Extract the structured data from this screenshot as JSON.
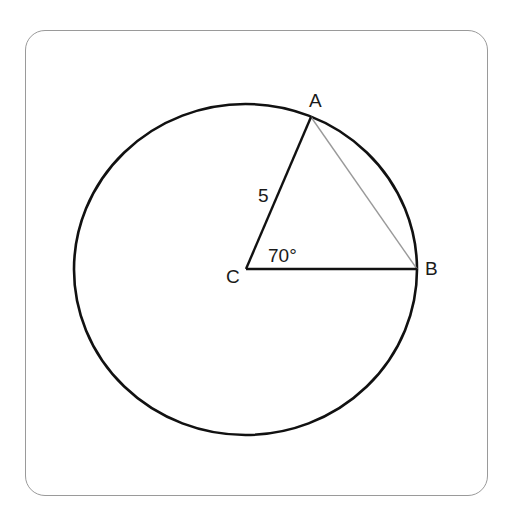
{
  "diagram": {
    "type": "geometry",
    "points": {
      "A": {
        "label": "A",
        "x": 311,
        "y": 117
      },
      "B": {
        "label": "B",
        "x": 417,
        "y": 269
      },
      "C": {
        "label": "C",
        "x": 246,
        "y": 269
      }
    },
    "labels": {
      "point_a": "A",
      "point_b": "B",
      "point_c": "C",
      "radius": "5",
      "angle": "70°"
    },
    "colors": {
      "stroke": "#111111",
      "chord": "#9a9a9a",
      "frame": "#9a9a9a"
    }
  }
}
